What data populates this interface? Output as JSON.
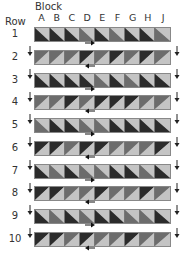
{
  "header": {
    "block_label": "Block",
    "row_label": "Row"
  },
  "columns": [
    "A",
    "B",
    "C",
    "D",
    "E",
    "F",
    "G",
    "H",
    "J"
  ],
  "colors": {
    "dark": "#2b2b2b",
    "mid": "#6c6c6c",
    "light": "#c4c4c4",
    "arrow": "#111111"
  },
  "rows": [
    {
      "label": "1",
      "diagonal": "tl-br",
      "arrow": "right",
      "blocks": [
        "dark",
        "dark",
        "dark",
        "mid",
        "dark",
        "mid",
        "dark",
        "dark",
        "mid"
      ]
    },
    {
      "label": "2",
      "diagonal": "bl-tr",
      "arrow": "left",
      "blocks": [
        "mid",
        "mid",
        "mid",
        "dark",
        "mid",
        "dark",
        "mid",
        "dark",
        "mid"
      ]
    },
    {
      "label": "3",
      "diagonal": "tl-br",
      "arrow": "right",
      "blocks": [
        "dark",
        "dark",
        "dark",
        "dark",
        "mid",
        "dark",
        "mid",
        "dark",
        "dark"
      ]
    },
    {
      "label": "4",
      "diagonal": "bl-tr",
      "arrow": "left",
      "blocks": [
        "mid",
        "mid",
        "dark",
        "mid",
        "dark",
        "dark",
        "dark",
        "mid",
        "mid"
      ]
    },
    {
      "label": "5",
      "diagonal": "tl-br",
      "arrow": "right",
      "blocks": [
        "mid",
        "dark",
        "dark",
        "mid",
        "mid",
        "dark",
        "dark",
        "dark",
        "dark"
      ]
    },
    {
      "label": "6",
      "diagonal": "bl-tr",
      "arrow": "left",
      "blocks": [
        "dark",
        "dark",
        "mid",
        "dark",
        "dark",
        "mid",
        "mid",
        "mid",
        "dark"
      ]
    },
    {
      "label": "7",
      "diagonal": "tl-br",
      "arrow": "right",
      "blocks": [
        "dark",
        "mid",
        "dark",
        "mid",
        "mid",
        "dark",
        "dark",
        "mid",
        "dark"
      ]
    },
    {
      "label": "8",
      "diagonal": "bl-tr",
      "arrow": "left",
      "blocks": [
        "dark",
        "dark",
        "mid",
        "mid",
        "dark",
        "mid",
        "mid",
        "dark",
        "mid"
      ]
    },
    {
      "label": "9",
      "diagonal": "tl-br",
      "arrow": "right",
      "blocks": [
        "dark",
        "mid",
        "dark",
        "mid",
        "dark",
        "dark",
        "mid",
        "mid",
        "dark"
      ]
    },
    {
      "label": "10",
      "diagonal": "bl-tr",
      "arrow": "left",
      "blocks": [
        "dark",
        "dark",
        "mid",
        "dark",
        "mid",
        "mid",
        "dark",
        "mid",
        "mid"
      ]
    }
  ]
}
